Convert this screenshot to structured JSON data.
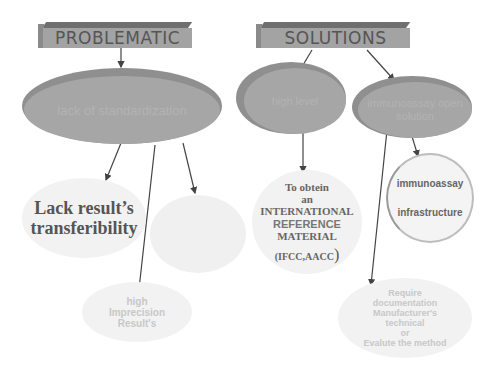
{
  "headers": {
    "problematic": "PROBLEMATIC",
    "solutions": "SOLUTIONS"
  },
  "problem_main": {
    "label": "lack of standardization"
  },
  "solution_nodes": [
    {
      "label": "high level"
    },
    {
      "label": "immunoassay open solution"
    }
  ],
  "problem_consequences": {
    "lack_transfer": {
      "line1": "Lack result’s",
      "line2": "transferibility"
    },
    "illegible": {
      "label": ""
    },
    "imprecision": {
      "line1": "high",
      "line2": "Imprecision",
      "line3": "Result's"
    }
  },
  "reference_material": {
    "line1": "To obtein",
    "line2": "an",
    "line3": "INTERNATIONAL",
    "line4": "REFERENCE",
    "line5": "MATERIAL",
    "line6": "(IFCC,AACC",
    "paren": ")"
  },
  "infrastructure": {
    "line1": "immunoassay",
    "line2": "infrastructure"
  },
  "documentation": {
    "line1": "Require",
    "line2": "documentation",
    "line3": "Manufacturer's",
    "line4": "technical",
    "line5": "or",
    "line6": "Evalute the method"
  }
}
